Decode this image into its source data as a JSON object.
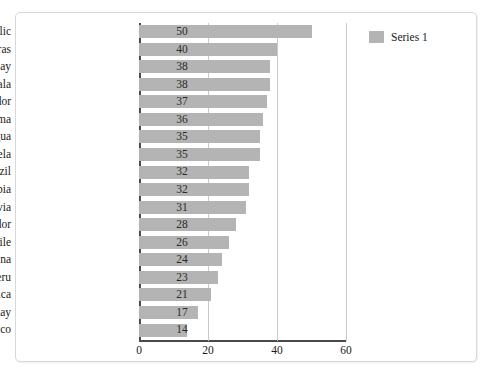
{
  "chart_data": {
    "type": "bar",
    "orientation": "horizontal",
    "title": "",
    "xlabel": "",
    "ylabel": "",
    "categories": [
      "Dominican Republic",
      "Honduras",
      "Paraguay",
      "Guatemala",
      "Ecuador",
      "Panama",
      "Nicaragua",
      "Venezuela",
      "Brazil",
      "Colombia",
      "Bolivia",
      "El Salvador",
      "Chile",
      "Argentina",
      "Peru",
      "Costa Rica",
      "Uruguay",
      "Mexico"
    ],
    "values": [
      50,
      40,
      38,
      38,
      37,
      36,
      35,
      35,
      32,
      32,
      31,
      28,
      26,
      24,
      23,
      21,
      17,
      14
    ],
    "series": [
      {
        "name": "Series 1",
        "values": [
          50,
          40,
          38,
          38,
          37,
          36,
          35,
          35,
          32,
          32,
          31,
          28,
          26,
          24,
          23,
          21,
          17,
          14
        ]
      }
    ],
    "xlim": [
      0,
      60
    ],
    "xticks": [
      0,
      20,
      40,
      60
    ],
    "xtick_labels": [
      "0",
      "20",
      "40",
      "60"
    ],
    "grid": true,
    "grid_axis": "x",
    "data_labels": true,
    "legend": {
      "position": "top-right",
      "entries": [
        {
          "label": "Series 1",
          "color": "#b4b4b4"
        }
      ]
    },
    "colors": {
      "bar": "#b4b4b4",
      "axis": "#4a4a4a",
      "gridline": "#c9c9c9",
      "text": "#1a1a1a",
      "frame_border": "#d8d8d8",
      "background": "#ffffff"
    }
  }
}
